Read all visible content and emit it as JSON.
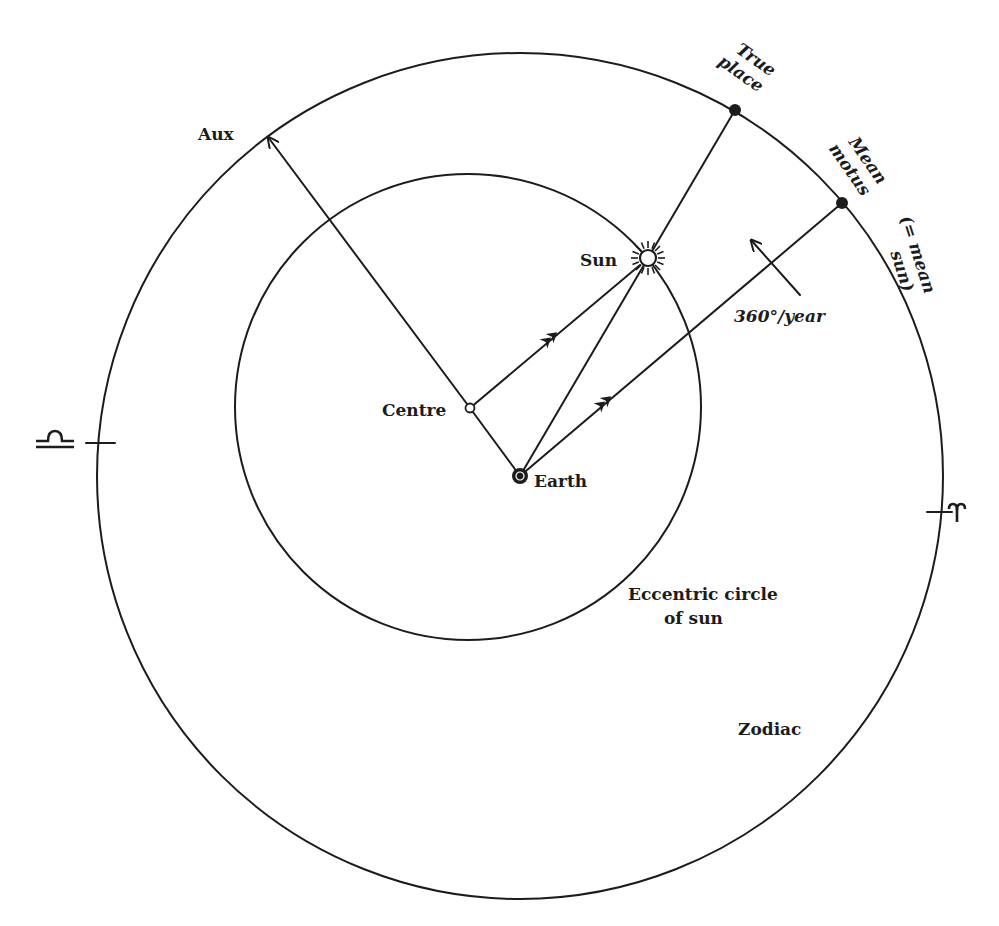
{
  "diagram": {
    "colors": {
      "ink": "#1c1c1c",
      "background": "#ffffff"
    },
    "labels": {
      "aux": "Aux",
      "true_place_1": "True",
      "true_place_2": "place",
      "mean_motus_1": "Mean",
      "mean_motus_2": "motus",
      "mean_sun_1": "(= mean",
      "mean_sun_2": "sun)",
      "sun": "Sun",
      "rate": "360°/year",
      "centre": "Centre",
      "earth": "Earth",
      "eccentric_1": "Eccentric circle",
      "eccentric_2": "of sun",
      "zodiac": "Zodiac",
      "libra_symbol": "♎",
      "aries_symbol": "♈"
    },
    "points": [
      {
        "name": "Earth",
        "x": 520,
        "y": 476
      },
      {
        "name": "Centre",
        "x": 470,
        "y": 408
      },
      {
        "name": "Sun",
        "x": 648,
        "y": 258
      },
      {
        "name": "True place",
        "x": 735,
        "y": 110
      },
      {
        "name": "Mean motus",
        "x": 842,
        "y": 203
      },
      {
        "name": "Aux",
        "x": 268,
        "y": 137
      }
    ],
    "circles": [
      {
        "name": "Zodiac",
        "cx": 520,
        "cy": 476,
        "r": 423
      },
      {
        "name": "Eccentric circle of sun",
        "cx": 468,
        "cy": 407,
        "r": 233
      }
    ]
  }
}
